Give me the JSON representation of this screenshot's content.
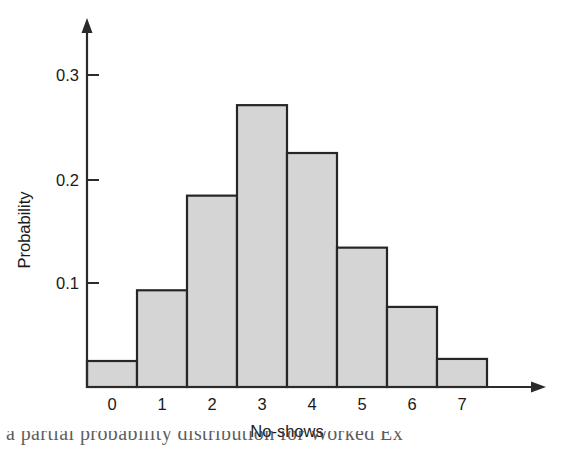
{
  "chart_data": {
    "type": "bar",
    "title": "",
    "subtitle": "",
    "xlabel": "No-shows",
    "ylabel": "Probability",
    "categories": [
      "0",
      "1",
      "2",
      "3",
      "4",
      "5",
      "6",
      "7"
    ],
    "values": [
      0.025,
      0.093,
      0.184,
      0.271,
      0.225,
      0.134,
      0.077,
      0.027
    ],
    "series": [
      {
        "name": "Probability",
        "values": [
          0.025,
          0.093,
          0.184,
          0.271,
          0.225,
          0.134,
          0.077,
          0.027
        ]
      }
    ],
    "ylim": [
      0,
      0.33
    ],
    "xlim": [
      -0.5,
      7.5
    ],
    "yticks": [
      0.1,
      0.2,
      0.3
    ],
    "ytick_labels": [
      "0.1",
      "0.2",
      "0.3"
    ],
    "xtick_labels": [
      "0",
      "1",
      "2",
      "3",
      "4",
      "5",
      "6",
      "7"
    ],
    "grid": false,
    "legend": null,
    "bar_fill_color": "#d5d5d5",
    "bar_edge_color": "#262626",
    "axis_color": "#2b2b2b",
    "background_color": "#ffffff",
    "axis_style": "arrow-tipped open axes"
  },
  "caption": {
    "text": "a partial probability distribution for Worked Ex"
  }
}
